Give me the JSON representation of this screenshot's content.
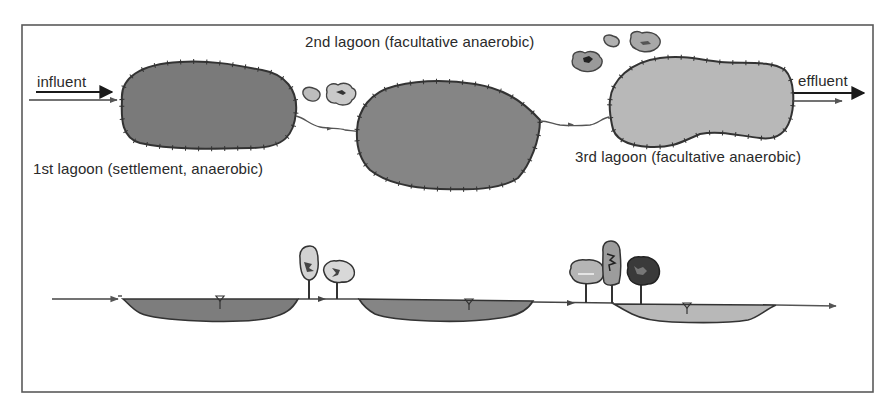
{
  "diagram": {
    "title_top": "2nd lagoon (facultative anaerobic)",
    "labels": {
      "influent": "influent",
      "effluent": "effluent",
      "lagoon1": "1st lagoon (settlement, anaerobic)",
      "lagoon2": "2nd lagoon (facultative anaerobic)",
      "lagoon3": "3rd lagoon (facultative anaerobic)"
    },
    "views": [
      {
        "name": "plan view",
        "elements": [
          "influent arrow",
          "1st lagoon",
          "shrubs",
          "2nd lagoon",
          "shrubs",
          "3rd lagoon",
          "effluent arrow"
        ]
      },
      {
        "name": "section view",
        "elements": [
          "inflow line",
          "1st lagoon basin",
          "trees",
          "2nd lagoon basin",
          "trees",
          "3rd lagoon basin",
          "outflow arrow"
        ]
      }
    ],
    "colors": {
      "frame": "#555555",
      "lagoon1_fill": "#7a7a7a",
      "lagoon2_fill": "#858585",
      "lagoon3_fill": "#b8b8b8",
      "outline": "#333333",
      "text": "#2a2a2a"
    }
  }
}
